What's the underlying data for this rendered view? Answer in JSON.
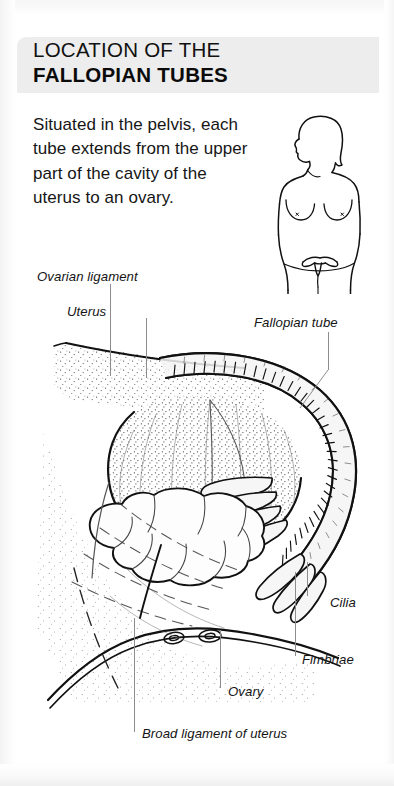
{
  "page": {
    "background": "#ffffff",
    "band_color": "#ededed",
    "ink_color": "#141414",
    "leader_color": "#8d8d8d"
  },
  "header": {
    "title_line1": "LOCATION OF THE",
    "title_line2": "FALLOPIAN TUBES"
  },
  "intro": {
    "text": "Situated in the pelvis, each tube extends from the upper part of the cavity of the uterus to an ovary."
  },
  "torso_figure": {
    "caption": "",
    "depicts": "female-torso-anterior-with-uterus-inset",
    "icon": "female-torso-icon"
  },
  "illustration": {
    "depicts": "cross-section-of-uterus-fallopian-tube-ovary-and-broad-ligament",
    "style": "line-drawing-with-stipple-shading"
  },
  "labels": {
    "ovarian_ligament": "Ovarian ligament",
    "uterus": "Uterus",
    "fallopian_tube": "Fallopian tube",
    "cilia": "Cilia",
    "fimbriae": "Fimbriae",
    "ovary": "Ovary",
    "broad_ligament": "Broad ligament of uterus"
  }
}
